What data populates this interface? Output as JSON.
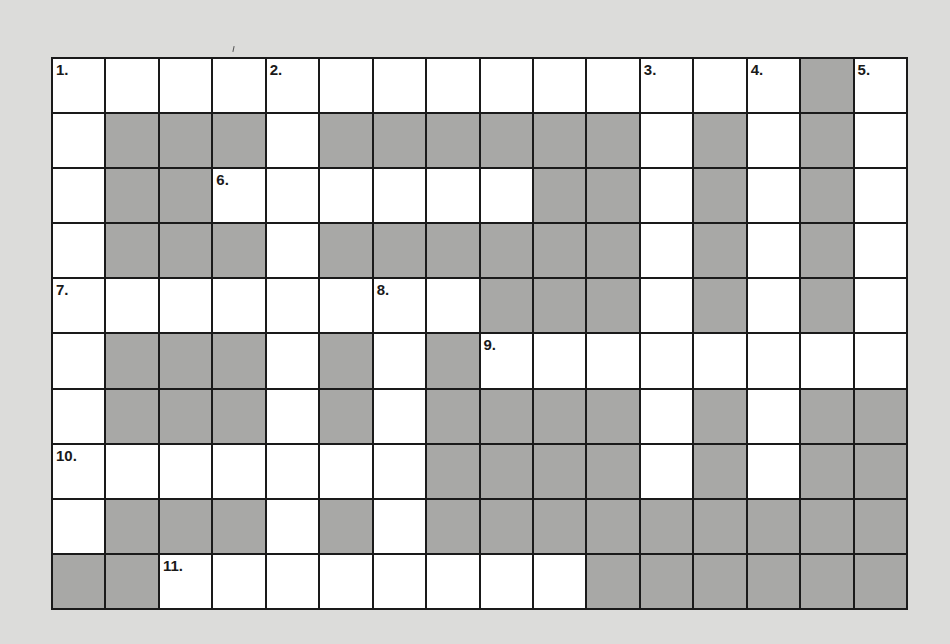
{
  "puzzle": {
    "rows": 10,
    "cols": 16,
    "colors": {
      "background": "#dcdcda",
      "white_cell": "#ffffff",
      "blocked_cell": "#a8a8a6",
      "grid_line": "#1a1a1a"
    },
    "layout": [
      "0000000000000010",
      "0111011111101010",
      "0110000001101010",
      "0111011111101010",
      "0000000011101010",
      "0111010100000000",
      "0111010111101011",
      "0000000111101011",
      "0111010111111111",
      "1100000000111111"
    ],
    "clue_numbers": [
      {
        "row": 0,
        "col": 0,
        "label": "1."
      },
      {
        "row": 0,
        "col": 4,
        "label": "2."
      },
      {
        "row": 0,
        "col": 11,
        "label": "3."
      },
      {
        "row": 0,
        "col": 13,
        "label": "4."
      },
      {
        "row": 0,
        "col": 15,
        "label": "5."
      },
      {
        "row": 2,
        "col": 3,
        "label": "6."
      },
      {
        "row": 4,
        "col": 0,
        "label": "7."
      },
      {
        "row": 4,
        "col": 6,
        "label": "8."
      },
      {
        "row": 5,
        "col": 8,
        "label": "9."
      },
      {
        "row": 7,
        "col": 0,
        "label": "10."
      },
      {
        "row": 9,
        "col": 2,
        "label": "11."
      }
    ]
  }
}
